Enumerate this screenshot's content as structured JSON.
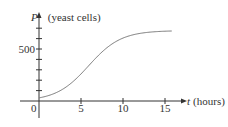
{
  "chart_data": {
    "type": "line",
    "title": "",
    "xlabel_var": "t",
    "xlabel_unit": "(hours)",
    "ylabel_var": "P",
    "ylabel_unit": "(yeast cells)",
    "x_ticks": [
      0,
      5,
      10,
      15
    ],
    "x_tick_labels": [
      "0",
      "5",
      "10",
      "15"
    ],
    "y_ticks_minor_step": 100,
    "y_tick_labels": [
      {
        "value": 500,
        "label": "500"
      }
    ],
    "xlim": [
      0,
      17.5
    ],
    "ylim": [
      0,
      750
    ],
    "grid": false,
    "series": [
      {
        "name": "Logistic growth of yeast population",
        "x": [
          0,
          1,
          2,
          3,
          4,
          5,
          6,
          7,
          8,
          9,
          10,
          11,
          12,
          13,
          14,
          15,
          15.8
        ],
        "values": [
          30,
          45,
          70,
          110,
          170,
          260,
          360,
          460,
          545,
          600,
          635,
          655,
          665,
          670,
          673,
          675,
          676
        ]
      }
    ],
    "colors": {
      "axis": "#333333",
      "curve": "#777777",
      "text": "#333333"
    }
  }
}
